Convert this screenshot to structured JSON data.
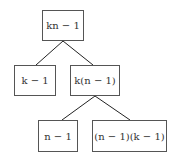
{
  "diagram": {
    "type": "tree",
    "nodes": [
      {
        "id": "root",
        "label": "kn − 1"
      },
      {
        "id": "left",
        "label": "k − 1"
      },
      {
        "id": "right",
        "label": "k(n − 1)"
      },
      {
        "id": "right-left",
        "label": "n − 1"
      },
      {
        "id": "right-right",
        "label": "(n − 1)(k − 1)"
      }
    ],
    "edges": [
      {
        "from": "root",
        "to": "left"
      },
      {
        "from": "root",
        "to": "right"
      },
      {
        "from": "right",
        "to": "right-left"
      },
      {
        "from": "right",
        "to": "right-right"
      }
    ],
    "colors": {
      "border": "#555555",
      "edge": "#222222",
      "text": "#333333",
      "background": "#ffffff"
    }
  }
}
